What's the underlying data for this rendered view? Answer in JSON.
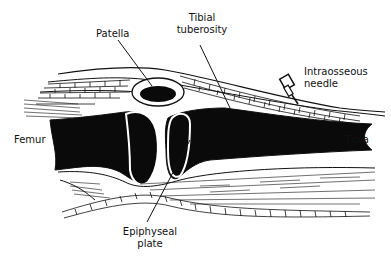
{
  "diagram": {
    "colors": {
      "bone": "#0a0a0a",
      "outline": "#111111",
      "background": "#ffffff"
    },
    "labels": {
      "patella": "Patella",
      "tibial_tuberosity_line1": "Tibial",
      "tibial_tuberosity_line2": "tuberosity",
      "intraosseous_needle_line1": "Intraosseous",
      "intraosseous_needle_line2": "needle",
      "femur": "Femur",
      "tibia": "Tibia",
      "epiphyseal_plate_line1": "Epiphyseal",
      "epiphyseal_plate_line2": "plate"
    }
  }
}
